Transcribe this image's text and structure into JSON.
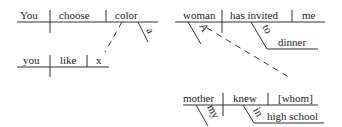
{
  "diagrams": {
    "left": {
      "main_clause": {
        "subject": "You",
        "verb": "choose",
        "object": "color",
        "modifiers": [
          {
            "word": "a",
            "modifies": "color"
          }
        ]
      },
      "relative_clause": {
        "subject": "you",
        "verb": "like",
        "object": "x"
      }
    },
    "right": {
      "main_clause": {
        "subject": "woman",
        "verb": "has invited",
        "object": "me",
        "modifiers": [
          {
            "word": "A",
            "modifies": "woman"
          },
          {
            "word": "to",
            "modifies": "has invited",
            "object": "dinner"
          }
        ]
      },
      "relative_clause": {
        "subject": "mother",
        "verb": "knew",
        "object": "[whom]",
        "modifiers": [
          {
            "word": "my",
            "modifies": "mother"
          },
          {
            "word": "in",
            "modifies": "knew",
            "object": "high school"
          }
        ]
      }
    }
  }
}
